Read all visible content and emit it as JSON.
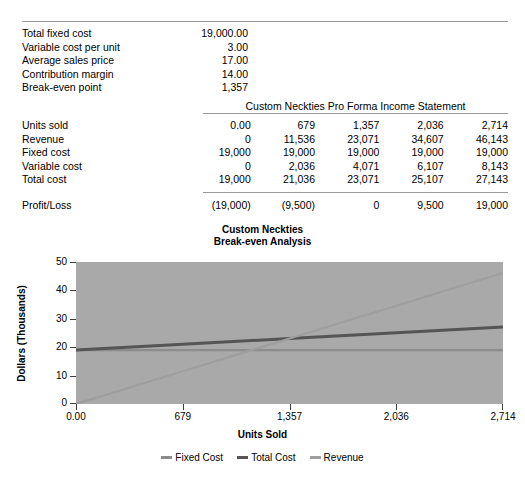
{
  "assumptions": {
    "rows": [
      {
        "label": "Total fixed cost",
        "value": "19,000.00"
      },
      {
        "label": "Variable cost per unit",
        "value": "3.00"
      },
      {
        "label": "Average sales price",
        "value": "17.00"
      },
      {
        "label": "Contribution margin",
        "value": "14.00"
      },
      {
        "label": "Break-even point",
        "value": "1,357"
      }
    ]
  },
  "statement": {
    "title": "Custom Neckties Pro Forma Income Statement",
    "rows": [
      {
        "label": "Units sold",
        "values": [
          "0.00",
          "679",
          "1,357",
          "2,036",
          "2,714"
        ]
      },
      {
        "label": "Revenue",
        "values": [
          "0",
          "11,536",
          "23,071",
          "34,607",
          "46,143"
        ]
      },
      {
        "label": "Fixed cost",
        "values": [
          "19,000",
          "19,000",
          "19,000",
          "19,000",
          "19,000"
        ]
      },
      {
        "label": "Variable cost",
        "values": [
          "0",
          "2,036",
          "4,071",
          "6,107",
          "8,143"
        ]
      },
      {
        "label": "Total cost",
        "values": [
          "19,000",
          "21,036",
          "23,071",
          "25,107",
          "27,143"
        ]
      }
    ],
    "profit_row": {
      "label": "Profit/Loss",
      "values": [
        "(19,000)",
        "(9,500)",
        "0",
        "9,500",
        "19,000"
      ]
    }
  },
  "chart_data": {
    "type": "line",
    "title": "Custom Neckties",
    "subtitle": "Break-even Analysis",
    "xlabel": "Units Sold",
    "ylabel": "Dollars (Thousands)",
    "x": [
      0,
      679,
      1357,
      2036,
      2714
    ],
    "xtick_labels": [
      "0.00",
      "679",
      "1,357",
      "2,036",
      "2,714"
    ],
    "ytick_labels": [
      "0",
      "10",
      "20",
      "30",
      "40",
      "50"
    ],
    "ylim": [
      0,
      50
    ],
    "yticks": [
      0,
      10,
      20,
      30,
      40,
      50
    ],
    "grid": false,
    "legend_position": "bottom",
    "plot_background": "#a9a9a9",
    "series": [
      {
        "name": "Fixed Cost",
        "color": "#8c8c8c",
        "values": [
          19.0,
          19.0,
          19.0,
          19.0,
          19.0
        ]
      },
      {
        "name": "Total Cost",
        "color": "#555555",
        "values": [
          19.0,
          21.036,
          23.071,
          25.107,
          27.143
        ]
      },
      {
        "name": "Revenue",
        "color": "#9e9e9e",
        "values": [
          0,
          11.536,
          23.071,
          34.607,
          46.143
        ]
      }
    ]
  }
}
